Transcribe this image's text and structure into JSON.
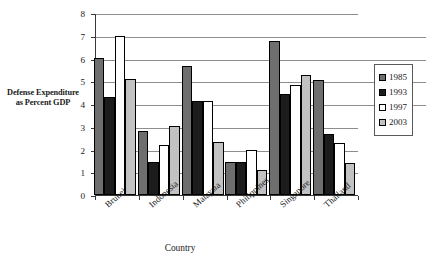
{
  "chart_data": {
    "type": "bar",
    "title": "",
    "xlabel": "Country",
    "ylabel": "Defense Expenditure as Percent GDP",
    "ylim": [
      0,
      8
    ],
    "ytick_values": [
      0,
      1,
      2,
      3,
      4,
      5,
      6,
      7,
      8
    ],
    "ytick_labels": [
      "0",
      "1",
      "2",
      "3",
      "4",
      "5",
      "6",
      "7",
      "8"
    ],
    "grid": true,
    "grid_axis": "y",
    "legend_position": "right",
    "categories": [
      "Brunei",
      "Indonesia",
      "Malaysia",
      "Philippines",
      "Singapore",
      "Thailand"
    ],
    "series": [
      {
        "name": "1985",
        "color": "#6e6e6e",
        "values": [
          6.02,
          2.82,
          5.65,
          1.45,
          6.78,
          5.05
        ]
      },
      {
        "name": "1993",
        "color": "#1c1c1c",
        "values": [
          4.29,
          1.44,
          4.14,
          1.45,
          4.44,
          2.67
        ]
      },
      {
        "name": "1997",
        "color": "#ffffff",
        "values": [
          7.0,
          2.22,
          4.14,
          1.96,
          4.85,
          2.29
        ]
      },
      {
        "name": "2003",
        "color": "#c2c2c2",
        "values": [
          5.12,
          3.04,
          2.35,
          1.08,
          5.28,
          1.39
        ]
      }
    ]
  },
  "legend": {
    "items": [
      {
        "label": "1985",
        "color": "#6e6e6e"
      },
      {
        "label": "1993",
        "color": "#1c1c1c"
      },
      {
        "label": "1997",
        "color": "#ffffff"
      },
      {
        "label": "2003",
        "color": "#c2c2c2"
      }
    ]
  },
  "axis_titles": {
    "y": "Defense Expenditure as Percent GDP",
    "x": "Country"
  }
}
